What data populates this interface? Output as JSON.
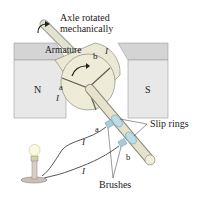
{
  "diagram": {
    "type": "ac-generator",
    "labels": {
      "axle": [
        "Axle rotated",
        "mechanically"
      ],
      "armature": "Armature",
      "north_pole": "N",
      "south_pole": "S",
      "terminal_a_top": "a",
      "terminal_b_top": "b",
      "terminal_a_ring": "a",
      "terminal_b_ring": "b",
      "current_symbol": "I",
      "slip_rings": "Slip rings",
      "brushes": "Brushes"
    },
    "colors": {
      "magnet_face": "#e6e6e6",
      "magnet_top": "#d2d2d2",
      "armature": "#ece8d6",
      "axle": "#dcdcc8",
      "slip_ring": "#bcdce8",
      "wire": "#555555",
      "text": "#1a1a1a"
    }
  }
}
